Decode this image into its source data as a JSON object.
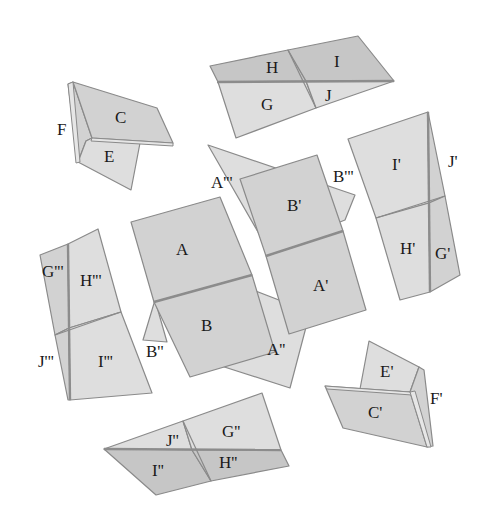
{
  "diagram": {
    "type": "folded-paper-pieces",
    "pieces": {
      "cef": {
        "labels": {
          "c": "C",
          "e": "E",
          "f": "F"
        }
      },
      "hijg": {
        "labels": {
          "h": "H",
          "i": "I",
          "g": "G",
          "j": "J"
        }
      },
      "prime_ijhg": {
        "labels": {
          "i": "I'",
          "j": "J'",
          "h": "H'",
          "g": "G'"
        }
      },
      "center": {
        "labels": {
          "a": "A",
          "b": "B",
          "a1": "A'",
          "b1": "B'",
          "a2": "A''",
          "b2": "B''",
          "a3": "A'''",
          "b3": "B'''"
        }
      },
      "triple_ghji": {
        "labels": {
          "g": "G'''",
          "h": "H'''",
          "j": "J'''",
          "i": "I'''"
        }
      },
      "prime_cef": {
        "labels": {
          "e": "E'",
          "c": "C'",
          "f": "F'"
        }
      },
      "double_jgih": {
        "labels": {
          "j": "J''",
          "g": "G''",
          "i": "I''",
          "h": "H''"
        }
      }
    },
    "colors": {
      "background": "#ffffff",
      "face_light": "#dedede",
      "face_mid": "#d2d2d2",
      "face_dark": "#c6c6c6",
      "outline": "#8a8a8a",
      "label": "#1a1a1a"
    }
  }
}
